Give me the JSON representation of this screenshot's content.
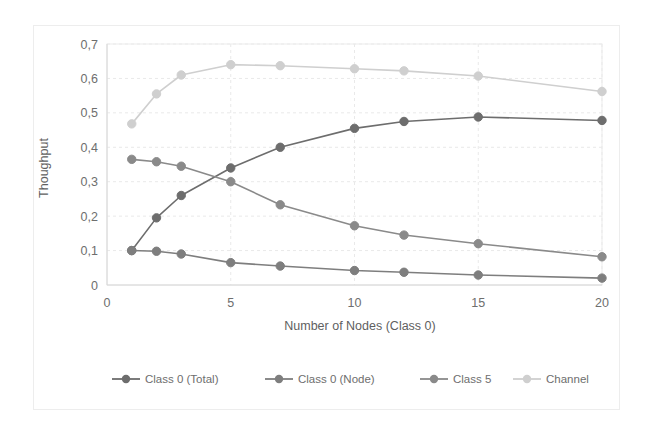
{
  "chart_data": {
    "type": "line",
    "title": "",
    "xlabel": "Number of  Nodes (Class 0)",
    "ylabel": "Thoughput",
    "x": [
      1,
      2,
      3,
      5,
      7,
      10,
      12,
      15,
      20
    ],
    "xlim": [
      0,
      20
    ],
    "ylim": [
      0,
      0.7
    ],
    "xticks": [
      "0",
      "5",
      "10",
      "15",
      "20"
    ],
    "xtick_values": [
      0,
      5,
      10,
      15,
      20
    ],
    "yticks": [
      "0",
      "0,1",
      "0,2",
      "0,3",
      "0,4",
      "0,5",
      "0,6",
      "0,7"
    ],
    "ytick_values": [
      0,
      0.1,
      0.2,
      0.3,
      0.4,
      0.5,
      0.6,
      0.7
    ],
    "grid": true,
    "legend_position": "bottom",
    "decimal_separator": ",",
    "series": [
      {
        "name": "Class 0 (Total)",
        "color": "#6d6d6d",
        "marker": "circle",
        "values": [
          0.1,
          0.195,
          0.26,
          0.34,
          0.4,
          0.455,
          0.475,
          0.488,
          0.478
        ]
      },
      {
        "name": "Class 0 (Node)",
        "color": "#7e7e7e",
        "marker": "circle",
        "values": [
          0.1,
          0.098,
          0.09,
          0.065,
          0.055,
          0.042,
          0.037,
          0.029,
          0.02
        ]
      },
      {
        "name": "Class 5",
        "color": "#8a8a8a",
        "marker": "circle",
        "values": [
          0.365,
          0.358,
          0.345,
          0.3,
          0.233,
          0.172,
          0.145,
          0.12,
          0.082
        ]
      },
      {
        "name": "Channel",
        "color": "#cfcfcf",
        "marker": "circle",
        "values": [
          0.468,
          0.555,
          0.61,
          0.64,
          0.637,
          0.628,
          0.622,
          0.607,
          0.562
        ]
      }
    ]
  },
  "colors": {
    "background": "#ffffff",
    "frame_border": "#ededed",
    "gridline": "#e9e9e9",
    "axis": "#d6d6d6",
    "text": "#6e6e6e"
  }
}
